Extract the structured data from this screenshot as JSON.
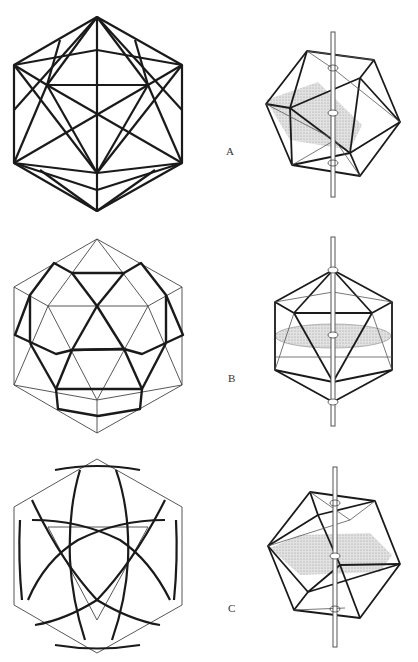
{
  "figure": {
    "rows": [
      {
        "label": "A",
        "left": "icosahedron-stellated-triangulation",
        "right": "icosahedron-with-rotation-axis-3fold"
      },
      {
        "label": "B",
        "left": "icosahedron-with-icosidodecahedron-pattern",
        "right": "icosahedron-with-rotation-axis-5fold"
      },
      {
        "label": "C",
        "left": "icosahedron-with-curved-band-pattern",
        "right": "icosahedron-with-rotation-axis-2fold"
      }
    ],
    "colors": {
      "line": "#1a1a1a",
      "thin_line": "#444444",
      "shade": "#c8c8c8",
      "axis": "#555555"
    }
  }
}
